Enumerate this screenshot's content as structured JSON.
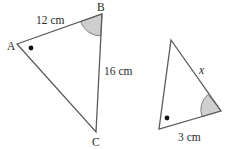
{
  "diagram": {
    "type": "similar-triangles",
    "triangle_1": {
      "vertices": {
        "A": {
          "label": "A"
        },
        "B": {
          "label": "B"
        },
        "C": {
          "label": "C"
        }
      },
      "sides": {
        "AB": "12 cm",
        "BC": "16 cm"
      },
      "angle_marks": {
        "A": "dot",
        "B": "shaded-arc"
      }
    },
    "triangle_2": {
      "sides": {
        "right_side": "x",
        "bottom_side": "3 cm"
      },
      "angle_marks": {
        "bottom_left": "dot",
        "right": "shaded-arc"
      }
    },
    "colors": {
      "line": "#5a5a5a",
      "arc_fill": "#cfcfcf",
      "text": "#2a2a2a",
      "dot": "#111111"
    }
  }
}
